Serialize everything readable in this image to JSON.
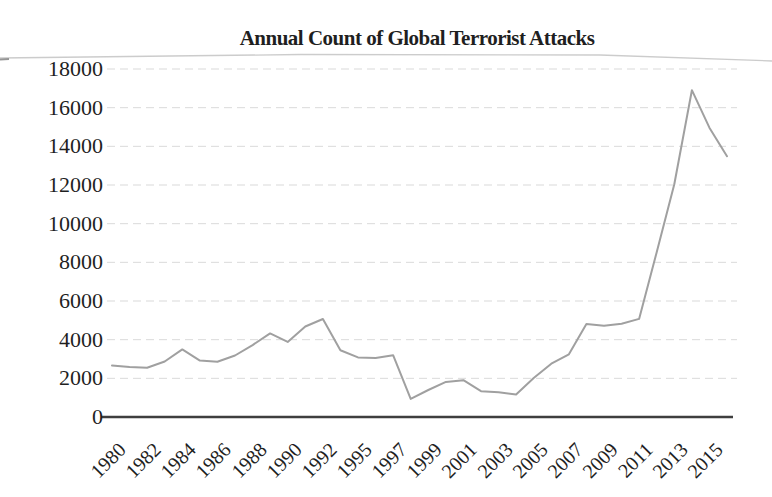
{
  "chart_data": {
    "type": "line",
    "title": "Annual Count of Global Terrorist Attacks",
    "xlabel": "",
    "ylabel": "",
    "x": [
      1980,
      1981,
      1982,
      1983,
      1984,
      1985,
      1986,
      1987,
      1988,
      1989,
      1990,
      1991,
      1992,
      1994,
      1995,
      1996,
      1997,
      1998,
      1999,
      2000,
      2001,
      2002,
      2003,
      2004,
      2005,
      2006,
      2007,
      2008,
      2009,
      2010,
      2011,
      2012,
      2013,
      2014,
      2015,
      2016
    ],
    "values": [
      2662,
      2586,
      2544,
      2870,
      3495,
      2915,
      2860,
      3183,
      3721,
      4324,
      3887,
      4683,
      5071,
      3456,
      3081,
      3058,
      3197,
      934,
      1395,
      1814,
      1906,
      1333,
      1278,
      1166,
      2017,
      2758,
      3242,
      4805,
      4721,
      4826,
      5076,
      8522,
      12036,
      16903,
      14965,
      13488
    ],
    "x_tick_labels": [
      "1980",
      "1982",
      "1984",
      "1986",
      "1988",
      "1990",
      "1992",
      "1995",
      "1997",
      "1999",
      "2001",
      "2003",
      "2005",
      "2007",
      "2009",
      "2011",
      "2013",
      "2015"
    ],
    "x_axis_note": "tick labels skip year 1993 (sequence jumps 1992 to 1995)",
    "y_ticks": [
      0,
      2000,
      4000,
      6000,
      8000,
      10000,
      12000,
      14000,
      16000,
      18000
    ],
    "ylim": [
      0,
      18000
    ],
    "grid": "horizontal dashed gridlines",
    "legend": "none"
  },
  "colors": {
    "background": "#ffffff",
    "text": "#1f1f1f",
    "line": "#a0a0a0",
    "axis": "#3e3e3e",
    "gridline": "#d9d9d9",
    "scan_artifact": "#c6c6c6"
  }
}
